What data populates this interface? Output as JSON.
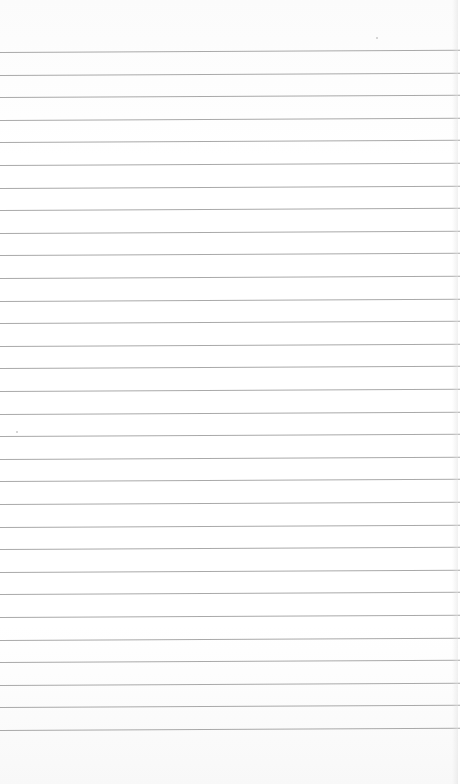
{
  "scene": {
    "subject": "blank lined paper",
    "background_color": "#ffffff",
    "rule_color": "#a9a9a9",
    "rules": {
      "count": 31,
      "first_y": 52,
      "spacing": 22.6
    },
    "specks": [
      {
        "x": 376,
        "y": 37
      },
      {
        "x": 16,
        "y": 431
      }
    ]
  }
}
